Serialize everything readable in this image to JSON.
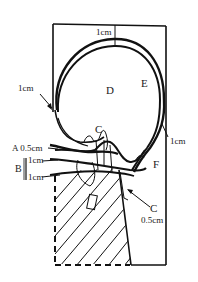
{
  "figure": {
    "type": "anatomical-schematic",
    "stroke_color": "#111111",
    "background": "#ffffff",
    "labels": {
      "top_margin": "1cm",
      "region_d": "D",
      "region_e": "E",
      "left_margin": "1cm",
      "region_c_upper": "C",
      "right_margin": "1cm",
      "label_a": "A 0.5cm",
      "label_b": "B",
      "b_upper": "1cm",
      "b_lower": "1cm",
      "region_f": "F",
      "region_c_lower": "C",
      "c_lower_margin": "0.5cm"
    }
  }
}
